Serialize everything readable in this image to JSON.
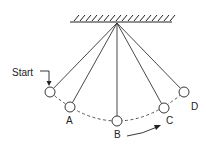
{
  "diagram": {
    "pivot": {
      "x": 117,
      "y": 23
    },
    "ceiling": {
      "x1": 70,
      "x2": 172,
      "y": 22,
      "hatch_count": 17
    },
    "balls": [
      {
        "id": "start",
        "label": "",
        "cx": 50,
        "cy": 92
      },
      {
        "id": "A",
        "label": "A",
        "cx": 70,
        "cy": 107,
        "lx": 66,
        "ly": 124
      },
      {
        "id": "B",
        "label": "B",
        "cx": 117,
        "cy": 121,
        "lx": 114,
        "ly": 138
      },
      {
        "id": "C",
        "label": "C",
        "cx": 164,
        "cy": 108,
        "lx": 166,
        "ly": 124
      },
      {
        "id": "D",
        "label": "D",
        "cx": 184,
        "cy": 92,
        "lx": 191,
        "ly": 110
      }
    ],
    "ball_radius": 5,
    "start_label": "Start",
    "colors": {
      "stroke": "#222222",
      "background": "#ffffff"
    }
  }
}
